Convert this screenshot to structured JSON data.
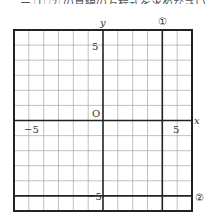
{
  "header_fragment": "ー ①,② の直線の方程式を求めなさい。",
  "graph": {
    "x_range": [
      -6,
      6
    ],
    "y_range": [
      -6,
      6
    ],
    "axis_labels": {
      "x": "x",
      "y": "y",
      "origin": "O"
    },
    "tick_labels": {
      "x_neg": "−5",
      "x_pos": "5",
      "y_pos": "5",
      "y_neg": "−5"
    },
    "lines": [
      {
        "label": "①",
        "type": "vertical",
        "x": 4
      },
      {
        "label": "②",
        "type": "horizontal",
        "y": -5
      }
    ]
  }
}
